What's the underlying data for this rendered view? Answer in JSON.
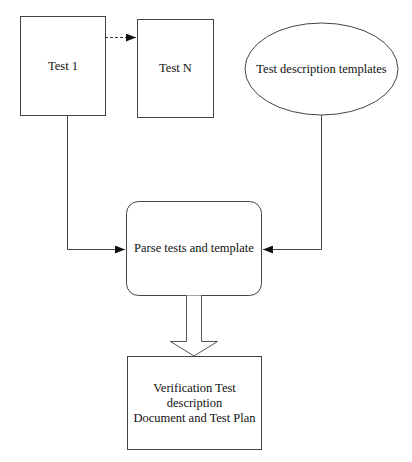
{
  "diagram": {
    "nodes": {
      "test1": {
        "label": "Test 1",
        "shape": "rectangle"
      },
      "testN": {
        "label": "Test N",
        "shape": "rectangle"
      },
      "templates": {
        "label": "Test description templates",
        "shape": "ellipse"
      },
      "parse": {
        "label": "Parse tests and template",
        "shape": "rounded-rectangle"
      },
      "output": {
        "label_lines": [
          "Verification Test",
          "description",
          "Document and Test Plan"
        ],
        "shape": "rectangle"
      }
    },
    "edges": [
      {
        "from": "test1",
        "to": "testN",
        "style": "dashed"
      },
      {
        "from": "test1",
        "to": "parse",
        "style": "solid"
      },
      {
        "from": "templates",
        "to": "parse",
        "style": "solid"
      },
      {
        "from": "parse",
        "to": "output",
        "style": "block-arrow"
      }
    ],
    "colors": {
      "stroke": "#333333",
      "fill": "#ffffff",
      "text": "#111111"
    }
  }
}
